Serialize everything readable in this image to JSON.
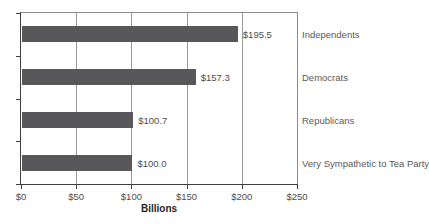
{
  "chart_data": {
    "type": "bar",
    "orientation": "horizontal",
    "title": "",
    "categories": [
      "Independents",
      "Democrats",
      "Republicans",
      "Very Sympathetic to Tea Party"
    ],
    "values": [
      195.5,
      157.3,
      100.7,
      100.0
    ],
    "value_labels": [
      "$195.5",
      "$157.3",
      "$100.7",
      "$100.0"
    ],
    "xlabel": "Billions",
    "ylabel": "",
    "xlim": [
      0,
      250
    ],
    "x_ticks": [
      0,
      50,
      100,
      150,
      200,
      250
    ],
    "x_tick_labels": [
      "$0",
      "$50",
      "$100",
      "$150",
      "$200",
      "$250"
    ],
    "grid": "vertical-gridlines-on",
    "legend": "none",
    "colors": {
      "bar": "#58585a",
      "gridline": "#999999",
      "axis": "#404040",
      "border": "#8c8c8c",
      "tick_label": "#4d4d4d",
      "category_label": "#595959",
      "value_label": "#4d4d4d",
      "background": "#ffffff"
    }
  }
}
